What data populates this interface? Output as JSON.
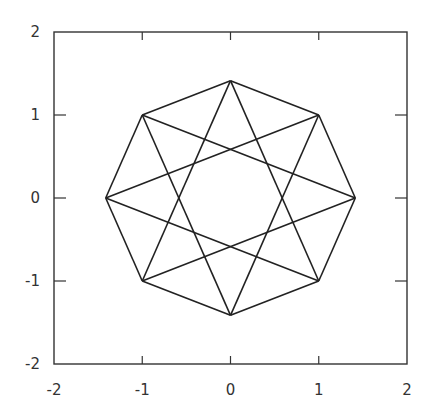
{
  "chart_data": {
    "type": "line",
    "title": "",
    "xlabel": "",
    "ylabel": "",
    "xlim": [
      -2,
      2
    ],
    "ylim": [
      -2,
      2
    ],
    "grid": false,
    "legend": null,
    "x_ticks": [
      "-2",
      "-1",
      "0",
      "1",
      "2"
    ],
    "y_ticks": [
      "-2",
      "-1",
      "0",
      "1",
      "2"
    ],
    "vertices": [
      {
        "x": 0,
        "y": 1.414
      },
      {
        "x": 1,
        "y": 1
      },
      {
        "x": 1.414,
        "y": 0
      },
      {
        "x": 1,
        "y": -1
      },
      {
        "x": 0,
        "y": -1.414
      },
      {
        "x": -1,
        "y": -1
      },
      {
        "x": -1.414,
        "y": 0
      },
      {
        "x": -1,
        "y": 1
      }
    ],
    "series": [
      {
        "name": "octagon",
        "connect_step": 1
      },
      {
        "name": "star-8-3",
        "connect_step": 3
      }
    ],
    "line_color": "#222222"
  }
}
